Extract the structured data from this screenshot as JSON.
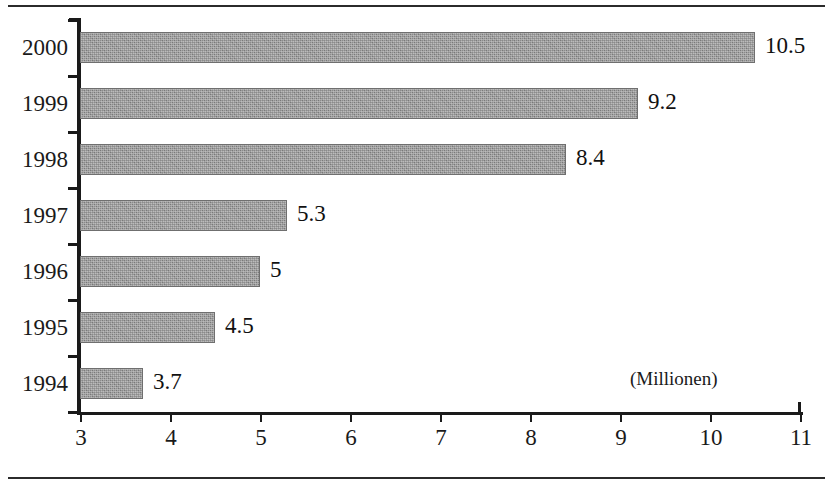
{
  "chart_data": {
    "type": "bar",
    "orientation": "horizontal",
    "title": "",
    "subtitle": "",
    "xlabel": "",
    "ylabel": "",
    "unit_note": "(Millionen)",
    "categories": [
      "2000",
      "1999",
      "1998",
      "1997",
      "1996",
      "1995",
      "1994"
    ],
    "values": [
      10.5,
      9.2,
      8.4,
      5.3,
      5,
      4.5,
      3.7
    ],
    "value_labels": [
      "10.5",
      "9.2",
      "8.4",
      "5.3",
      "5",
      "4.5",
      "3.7"
    ],
    "xlim": [
      3,
      11
    ],
    "xticks": [
      3,
      4,
      5,
      6,
      7,
      8,
      9,
      10,
      11
    ],
    "xtick_labels": [
      "3",
      "4",
      "5",
      "6",
      "7",
      "8",
      "9",
      "10",
      "11"
    ],
    "grid": false,
    "legend": null,
    "series": [
      {
        "name": "",
        "values": [
          10.5,
          9.2,
          8.4,
          5.3,
          5,
          4.5,
          3.7
        ],
        "color": "#8b8b8b"
      }
    ],
    "colors": {
      "bar_fill": "#8b8b8b",
      "bar_edge": "#6f6f6f",
      "axis": "#1a1a1a",
      "text": "#1a1a1a",
      "background": "#ffffff"
    }
  }
}
